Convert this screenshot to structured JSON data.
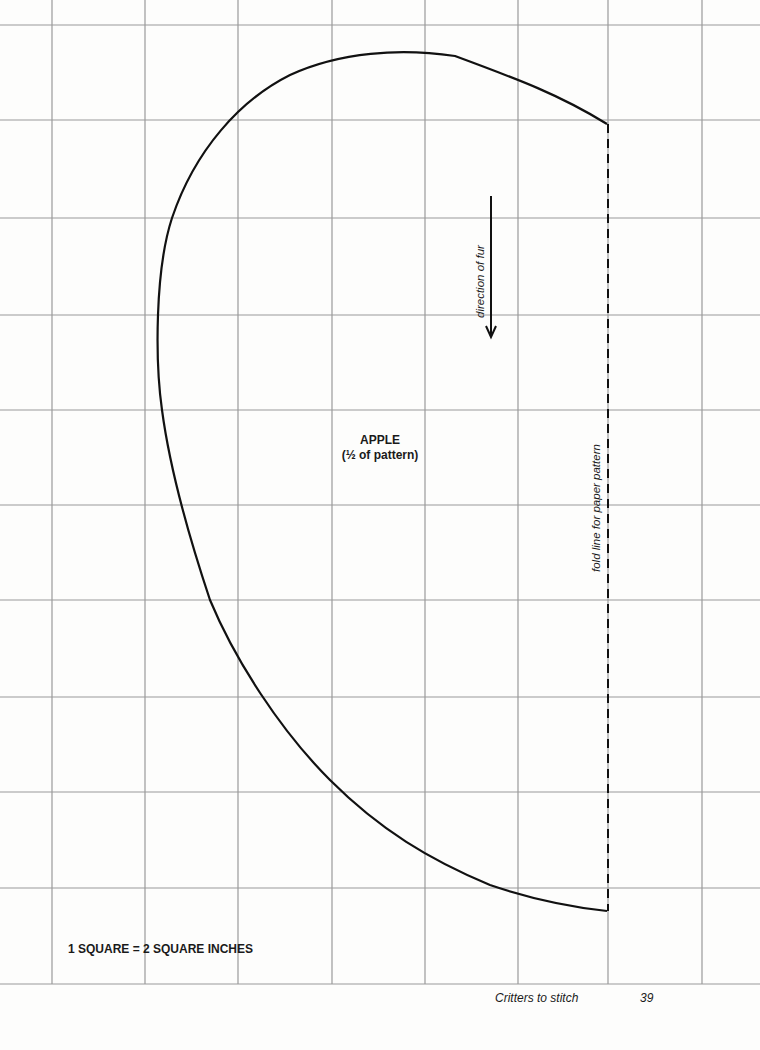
{
  "pattern": {
    "title": "APPLE",
    "subtitle": "(½ of pattern)",
    "direction_label": "direction of fur",
    "fold_label": "fold line for paper pattern",
    "scale_note": "1 SQUARE = 2 SQUARE INCHES"
  },
  "footer": {
    "book_title": "Critters to stitch",
    "page_number": "39"
  },
  "grid": {
    "vertical_lines_x": [
      52,
      145,
      238,
      332,
      425,
      518,
      608,
      702
    ],
    "horizontal_lines_y": [
      25,
      120,
      218,
      315,
      410,
      505,
      600,
      697,
      792,
      888,
      984
    ],
    "line_color": "#9a9a9a"
  },
  "colors": {
    "outline": "#111111",
    "background": "#fdfdfc"
  }
}
